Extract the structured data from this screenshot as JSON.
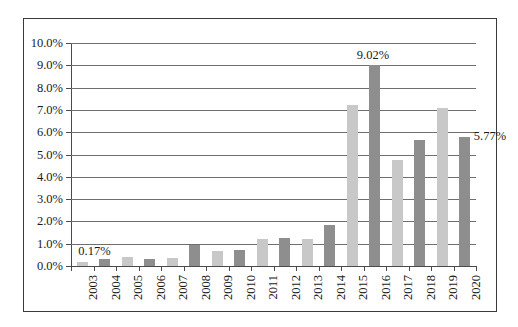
{
  "chart_data": {
    "type": "bar",
    "title": "",
    "subtitle": "",
    "xlabel": "",
    "ylabel": "",
    "ylim": [
      0,
      10
    ],
    "y_tick_labels": [
      "10.0%",
      "9.0%",
      "8.0%",
      "7.0%",
      "6.0%",
      "5.0%",
      "4.0%",
      "3.0%",
      "2.0%",
      "1.0%",
      "0.0%"
    ],
    "y_tick_values": [
      10,
      9,
      8,
      7,
      6,
      5,
      4,
      3,
      2,
      1,
      0
    ],
    "grid": true,
    "legend": "none",
    "categories": [
      "2003",
      "2004",
      "2005",
      "2006",
      "2007",
      "2008",
      "2009",
      "2010",
      "2011",
      "2012",
      "2013",
      "2014",
      "2015",
      "2016",
      "2017",
      "2018",
      "2019",
      "2020"
    ],
    "values": [
      0.17,
      0.33,
      0.42,
      0.3,
      0.36,
      0.92,
      0.68,
      0.73,
      1.22,
      1.25,
      1.22,
      1.82,
      7.2,
      9.02,
      4.75,
      5.65,
      7.1,
      5.77
    ],
    "bar_colors": [
      "light",
      "dark",
      "light",
      "dark",
      "light",
      "dark",
      "light",
      "dark",
      "light",
      "dark",
      "light",
      "dark",
      "light",
      "dark",
      "light",
      "dark",
      "light",
      "dark"
    ],
    "colors": {
      "light": "#c8c8c8",
      "dark": "#8e8e8e",
      "gridline": "#6e6e6e",
      "axis": "#4a4a4a",
      "border": "#3a3a3a",
      "text": "#1a1a1a",
      "background": "#ffffff"
    },
    "annotations": [
      {
        "text": "0.17%",
        "category": "2003",
        "value": 0.17
      },
      {
        "text": "9.02%",
        "category": "2016",
        "value": 9.02
      },
      {
        "text": "5.77%",
        "category": "2020",
        "value": 5.77
      }
    ]
  }
}
